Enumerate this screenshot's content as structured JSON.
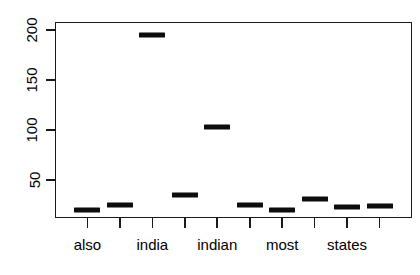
{
  "chart_data": {
    "type": "bar",
    "title": "",
    "subtitle": "",
    "xlabel": "",
    "ylabel": "",
    "grid": false,
    "legend": false,
    "legend_position": "none",
    "ylim": [
      12,
      208
    ],
    "yticks": [
      50,
      100,
      150,
      200
    ],
    "ytick_labels": [
      "50",
      "100",
      "150",
      "200"
    ],
    "categories": [
      "also",
      "",
      "india",
      "",
      "indian",
      "",
      "most",
      "",
      "states",
      ""
    ],
    "visible_xtick_labels": [
      "also",
      "india",
      "indian",
      "most",
      "states"
    ],
    "values": [
      20,
      25,
      195,
      35,
      103,
      25,
      20,
      31,
      23,
      24
    ],
    "n_categories": 10,
    "marker": "median-bar",
    "marker_color": "#0d0d0d",
    "axis_color": "#1a1a1a",
    "background": "#ffffff",
    "points": [
      {
        "index": 1,
        "category": "also",
        "value": 20,
        "labeled": true
      },
      {
        "index": 2,
        "category": "",
        "value": 25,
        "labeled": false
      },
      {
        "index": 3,
        "category": "india",
        "value": 195,
        "labeled": true
      },
      {
        "index": 4,
        "category": "",
        "value": 35,
        "labeled": false
      },
      {
        "index": 5,
        "category": "indian",
        "value": 103,
        "labeled": true
      },
      {
        "index": 6,
        "category": "",
        "value": 25,
        "labeled": false
      },
      {
        "index": 7,
        "category": "most",
        "value": 20,
        "labeled": true
      },
      {
        "index": 8,
        "category": "",
        "value": 31,
        "labeled": false
      },
      {
        "index": 9,
        "category": "states",
        "value": 23,
        "labeled": true
      },
      {
        "index": 10,
        "category": "",
        "value": 24,
        "labeled": false
      }
    ]
  },
  "axes": {
    "y": {
      "ticks": [
        {
          "value": 200,
          "label": "200"
        },
        {
          "value": 150,
          "label": "150"
        },
        {
          "value": 100,
          "label": "100"
        },
        {
          "value": 50,
          "label": "50"
        }
      ]
    },
    "x": {
      "ticks": [
        {
          "index": 1,
          "label": "also"
        },
        {
          "index": 2,
          "label": ""
        },
        {
          "index": 3,
          "label": "india"
        },
        {
          "index": 4,
          "label": ""
        },
        {
          "index": 5,
          "label": "indian"
        },
        {
          "index": 6,
          "label": ""
        },
        {
          "index": 7,
          "label": "most"
        },
        {
          "index": 8,
          "label": ""
        },
        {
          "index": 9,
          "label": "states"
        },
        {
          "index": 10,
          "label": ""
        }
      ]
    }
  }
}
